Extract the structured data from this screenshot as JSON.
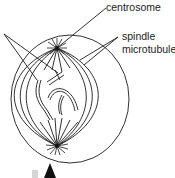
{
  "diagram": {
    "type": "cell-division-mitosis",
    "labels": {
      "centrosome": "centrosome",
      "spindle_line1": "spindle",
      "spindle_line2": "microtubules"
    },
    "elements": [
      "cell-membrane",
      "nuclear-region",
      "centrosome-top",
      "centrosome-bottom",
      "spindle-microtubules",
      "chromosomes",
      "pointer-arrow"
    ],
    "colors": {
      "stroke": "#1a1a1a",
      "text": "#222222",
      "background": "#ffffff",
      "arrow": "#111111",
      "faint_mark": "#cfcfcf"
    }
  }
}
